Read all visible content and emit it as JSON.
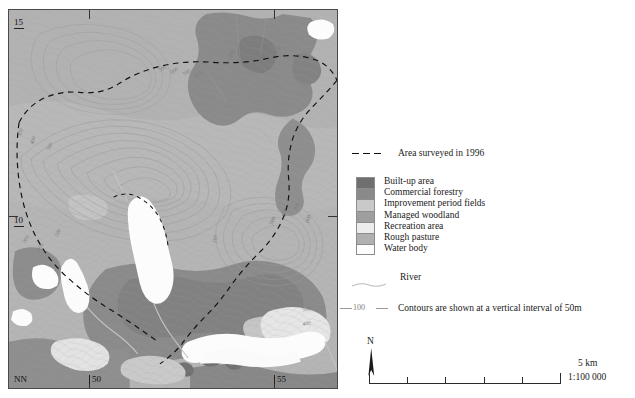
{
  "map": {
    "grid_labels": {
      "top_left": "15",
      "left_mid": "10",
      "bottom_left": "NN",
      "bottom_1": "50",
      "bottom_2": "55"
    },
    "contour_labels": [
      "300",
      "400",
      "500",
      "500",
      "400",
      "300",
      "200",
      "300",
      "400",
      "500",
      "600",
      "700",
      "800",
      "600",
      "700",
      "800",
      "900",
      "500",
      "600",
      "700",
      "800",
      "500",
      "400",
      "300",
      "200"
    ],
    "colors": {
      "built_up_area": "#6f6f6f",
      "commercial_forestry": "#8a8a8a",
      "improvement_period_fields": "#c9c9c9",
      "managed_woodland": "#9e9e9e",
      "recreation_area": "#e2e2e2",
      "rough_pasture": "#b5b5b5",
      "water_body": "#fcfcfc",
      "contour_line": "#9a9a9a",
      "survey_boundary": "#111111",
      "river": "#bdbdbd",
      "frame": "#4a4a4a"
    }
  },
  "legend": {
    "surveyed": {
      "label": "Area surveyed in 1996"
    },
    "classes": [
      {
        "label": "Built-up area",
        "color": "#6f6f6f"
      },
      {
        "label": "Commercial forestry",
        "color": "#8a8a8a"
      },
      {
        "label": "Improvement period fields",
        "color": "#c9c9c9"
      },
      {
        "label": "Managed woodland",
        "color": "#9e9e9e"
      },
      {
        "label": "Recreation area",
        "color": "#ececec"
      },
      {
        "label": "Rough pasture",
        "color": "#b0b0b0"
      },
      {
        "label": "Water body",
        "color": "#fdfdfd"
      }
    ],
    "river": {
      "label": "River"
    },
    "contours": {
      "sample_value": "100",
      "label": "Contours are shown at a vertical interval of 50m"
    }
  },
  "north_arrow": {
    "label": "N"
  },
  "scale": {
    "bar_label": "5 km",
    "ratio": "1:100 000",
    "divisions": 5
  }
}
